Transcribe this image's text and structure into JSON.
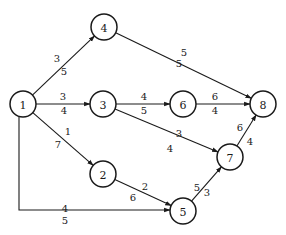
{
  "diagram": {
    "type": "directed-network",
    "node_radius": 13,
    "nodes": [
      {
        "id": "1",
        "label": "1",
        "x": 23,
        "y": 104
      },
      {
        "id": "2",
        "label": "2",
        "x": 103,
        "y": 174
      },
      {
        "id": "3",
        "label": "3",
        "x": 103,
        "y": 104
      },
      {
        "id": "4",
        "label": "4",
        "x": 104,
        "y": 27
      },
      {
        "id": "5",
        "label": "5",
        "x": 183,
        "y": 211
      },
      {
        "id": "6",
        "label": "6",
        "x": 183,
        "y": 104
      },
      {
        "id": "7",
        "label": "7",
        "x": 230,
        "y": 157
      },
      {
        "id": "8",
        "label": "8",
        "x": 263,
        "y": 104
      }
    ],
    "edges": [
      {
        "from": "1",
        "to": "4",
        "top": "3",
        "bottom": "5",
        "top_pos": [
          57,
          58
        ],
        "bottom_pos": [
          64,
          71
        ]
      },
      {
        "from": "1",
        "to": "3",
        "top": "3",
        "bottom": "4",
        "top_pos": [
          63,
          96
        ],
        "bottom_pos": [
          64,
          110
        ]
      },
      {
        "from": "1",
        "to": "2",
        "top": "1",
        "bottom": "7",
        "top_pos": [
          68,
          131
        ],
        "bottom_pos": [
          58,
          144
        ]
      },
      {
        "from": "1",
        "to": "5",
        "top": "4",
        "bottom": "5",
        "top_pos": [
          65,
          208
        ],
        "bottom_pos": [
          65,
          220
        ],
        "routed": true
      },
      {
        "from": "4",
        "to": "8",
        "top": "5",
        "bottom": "5",
        "top_pos": [
          184,
          52
        ],
        "bottom_pos": [
          179,
          63
        ]
      },
      {
        "from": "3",
        "to": "6",
        "top": "4",
        "bottom": "5",
        "top_pos": [
          144,
          96
        ],
        "bottom_pos": [
          144,
          110
        ]
      },
      {
        "from": "3",
        "to": "7",
        "top": "3",
        "bottom": "4",
        "top_pos": [
          179,
          133
        ],
        "bottom_pos": [
          170,
          148
        ]
      },
      {
        "from": "6",
        "to": "8",
        "top": "6",
        "bottom": "4",
        "top_pos": [
          215,
          96
        ],
        "bottom_pos": [
          215,
          110
        ]
      },
      {
        "from": "2",
        "to": "5",
        "top": "2",
        "bottom": "6",
        "top_pos": [
          145,
          186
        ],
        "bottom_pos": [
          133,
          197
        ]
      },
      {
        "from": "5",
        "to": "7",
        "top": "5",
        "bottom": "3",
        "top_pos": [
          197,
          187
        ],
        "bottom_pos": [
          207,
          192
        ]
      },
      {
        "from": "7",
        "to": "8",
        "top": "6",
        "bottom": "4",
        "top_pos": [
          240,
          127
        ],
        "bottom_pos": [
          250,
          141
        ]
      }
    ]
  }
}
